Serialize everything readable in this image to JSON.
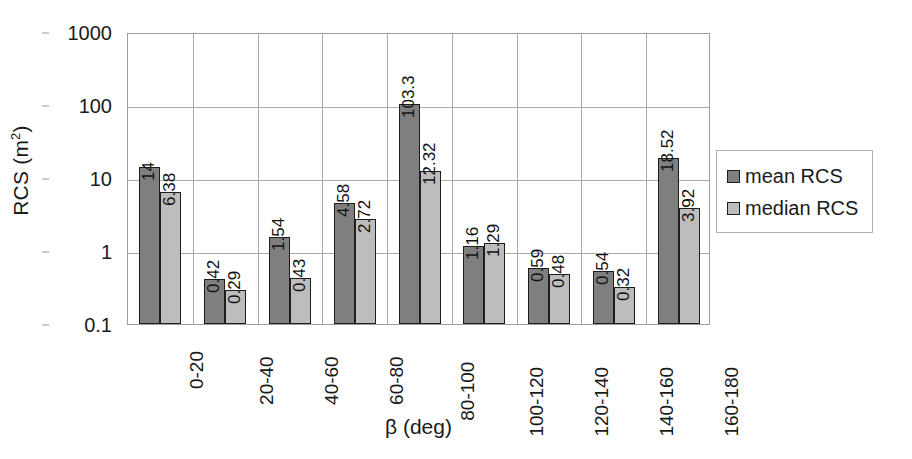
{
  "chart_data": {
    "type": "bar",
    "title": "",
    "xlabel": "β (deg)",
    "ylabel": "RCS (m²)",
    "yscale": "log",
    "ylim": [
      0.1,
      1000
    ],
    "ytick_labels": [
      "1000",
      "100",
      "10",
      "1",
      "0.1"
    ],
    "ytick_values": [
      1000,
      100,
      10,
      1,
      0.1
    ],
    "grid": true,
    "legend_position": "right",
    "categories": [
      "0-20",
      "20-40",
      "40-60",
      "60-80",
      "80-100",
      "100-120",
      "120-140",
      "140-160",
      "160-180"
    ],
    "series": [
      {
        "name": "mean RCS",
        "color": "#7f7f7f",
        "values": [
          14,
          0.42,
          1.54,
          4.58,
          103.3,
          1.16,
          0.59,
          0.54,
          18.52
        ],
        "labels": [
          "14",
          "0.42",
          "1.54",
          "4.58",
          "103.3",
          "1.16",
          "0.59",
          "0.54",
          "18.52"
        ]
      },
      {
        "name": "median RCS",
        "color": "#bdbdbd",
        "values": [
          6.38,
          0.29,
          0.43,
          2.72,
          12.32,
          1.29,
          0.48,
          0.32,
          3.92
        ],
        "labels": [
          "6.38",
          "0.29",
          "0.43",
          "2.72",
          "12.32",
          "1.29",
          "0.48",
          "0.32",
          "3.92"
        ]
      }
    ]
  },
  "axis": {
    "y_title_main": "RCS (m",
    "y_title_sup": "2",
    "y_title_close": ")",
    "x_title": "β (deg)"
  },
  "legend": {
    "items": [
      {
        "label": "mean RCS",
        "color": "#7f7f7f"
      },
      {
        "label": "median RCS",
        "color": "#bdbdbd"
      }
    ]
  }
}
